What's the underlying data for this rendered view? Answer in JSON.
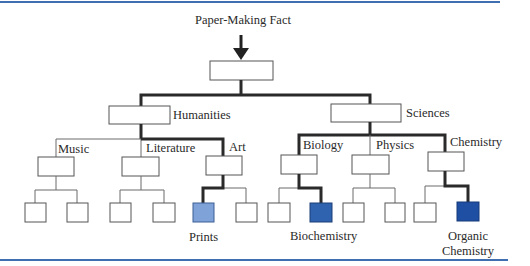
{
  "title": "Paper-Making Fact",
  "colors": {
    "rule": "#3f6fb0",
    "path": "#2a2a2a",
    "thin": "#6a6a6a",
    "prints": "#7fa3d8",
    "biochemistry": "#2f63b0",
    "organic_chemistry": "#1e4fa3"
  },
  "tree": {
    "root": {
      "label": ""
    },
    "level1": [
      {
        "label": "Humanities",
        "children": [
          {
            "label": "Music"
          },
          {
            "label": "Literature"
          },
          {
            "label": "Art"
          }
        ]
      },
      {
        "label": "Sciences",
        "children": [
          {
            "label": "Biology"
          },
          {
            "label": "Physics"
          },
          {
            "label": "Chemistry"
          }
        ]
      }
    ]
  },
  "highlighted_leaves": [
    {
      "label": "Prints",
      "parent": "Art"
    },
    {
      "label": "Biochemistry",
      "parent": "Biology"
    },
    {
      "label": "Organic Chemistry",
      "line1": "Organic",
      "line2": "Chemistry",
      "parent": "Chemistry"
    }
  ]
}
